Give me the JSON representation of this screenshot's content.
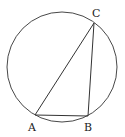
{
  "diagram": {
    "type": "inscribed-triangle",
    "circle": {
      "cx": 62,
      "cy": 67,
      "r": 55
    },
    "points": [
      {
        "id": "A",
        "label": "A",
        "x": 35,
        "y": 115,
        "lx": 28,
        "ly": 131
      },
      {
        "id": "B",
        "label": "B",
        "x": 88,
        "y": 116,
        "lx": 84,
        "ly": 131
      },
      {
        "id": "C",
        "label": "C",
        "x": 94,
        "y": 23,
        "lx": 92,
        "ly": 17
      }
    ],
    "segments": [
      {
        "from": "A",
        "to": "B"
      },
      {
        "from": "B",
        "to": "C"
      },
      {
        "from": "A",
        "to": "C"
      }
    ],
    "colors": {
      "stroke": "#333333",
      "label": "#222222"
    }
  }
}
